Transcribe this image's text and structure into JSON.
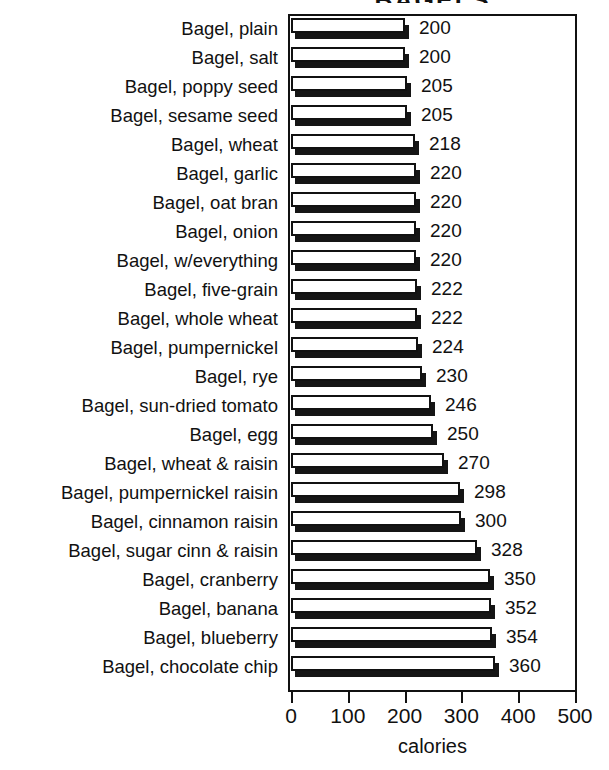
{
  "chart_data": {
    "type": "bar",
    "orientation": "horizontal",
    "title": "BAGELS",
    "xlabel": "calories",
    "ylabel": "",
    "xlim": [
      0,
      500
    ],
    "xticks": [
      0,
      100,
      200,
      300,
      400,
      500
    ],
    "grid": false,
    "legend": null,
    "categories": [
      "Bagel, plain",
      "Bagel, salt",
      "Bagel, poppy seed",
      "Bagel, sesame seed",
      "Bagel, wheat",
      "Bagel, garlic",
      "Bagel, oat bran",
      "Bagel, onion",
      "Bagel, w/everything",
      "Bagel, five-grain",
      "Bagel, whole wheat",
      "Bagel, pumpernickel",
      "Bagel, rye",
      "Bagel, sun-dried tomato",
      "Bagel, egg",
      "Bagel, wheat & raisin",
      "Bagel, pumpernickel raisin",
      "Bagel, cinnamon raisin",
      "Bagel, sugar cinn & raisin",
      "Bagel, cranberry",
      "Bagel, banana",
      "Bagel, blueberry",
      "Bagel, chocolate chip"
    ],
    "values": [
      200,
      200,
      205,
      205,
      218,
      220,
      220,
      220,
      220,
      222,
      222,
      224,
      230,
      246,
      250,
      270,
      298,
      300,
      328,
      350,
      352,
      354,
      360
    ],
    "value_labels": [
      "200",
      "200",
      "205",
      "205",
      "218",
      "220",
      "220",
      "220",
      "220",
      "222",
      "222",
      "224",
      "230",
      "246",
      "250",
      "270",
      "298",
      "300",
      "328",
      "350",
      "352",
      "354",
      "360"
    ],
    "bar_style": {
      "fill": "#ffffff",
      "edge": "#111111",
      "shadow": "#151515"
    }
  }
}
